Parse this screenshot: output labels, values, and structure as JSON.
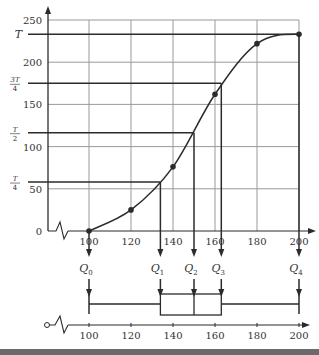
{
  "chart_data": {
    "type": "line",
    "title": "",
    "subtitle": "Cumulative frequency curve with quartiles and box plot",
    "xlabel": "",
    "ylabel": "",
    "x_ticks": [
      100,
      120,
      140,
      160,
      180,
      200
    ],
    "y_ticks": [
      0,
      50,
      100,
      150,
      200,
      250
    ],
    "xlim": [
      100,
      200
    ],
    "ylim": [
      0,
      250
    ],
    "grid": true,
    "legend": null,
    "series": [
      {
        "name": "cumulative frequency",
        "x": [
          100,
          120,
          140,
          160,
          180,
          200
        ],
        "y": [
          0,
          25,
          76,
          162,
          222,
          233
        ]
      }
    ],
    "reference_lines": [
      {
        "label": "T",
        "y": 233
      },
      {
        "label": "3T/4",
        "y": 175
      },
      {
        "label": "T/2",
        "y": 116.5
      },
      {
        "label": "T/4",
        "y": 58
      }
    ],
    "quartiles": [
      {
        "label": "Q0",
        "x": 100
      },
      {
        "label": "Q1",
        "x": 134
      },
      {
        "label": "Q2",
        "x": 150
      },
      {
        "label": "Q3",
        "x": 163
      },
      {
        "label": "Q4",
        "x": 200
      }
    ],
    "boxplot": {
      "min": 100,
      "q1": 134,
      "median": 150,
      "q3": 163,
      "max": 200
    }
  },
  "labels": {
    "T": "T",
    "three_quarter_T_num": "3T",
    "three_quarter_T_den": "4",
    "half_T_num": "T",
    "half_T_den": "2",
    "quarter_T_num": "T",
    "quarter_T_den": "4"
  },
  "colors": {
    "line": "#2b2b2b",
    "grid": "#9a9a9a",
    "text": "#333333"
  }
}
